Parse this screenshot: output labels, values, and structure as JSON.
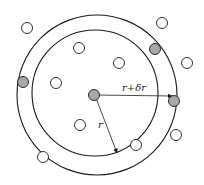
{
  "diagram": {
    "colors": {
      "line": "#1a1a1a",
      "filled": "#a8a8a8",
      "open": "#ffffff"
    },
    "outer_circle": {
      "cx": 97,
      "cy": 95,
      "r": 80
    },
    "inner_circle": {
      "cx": 95,
      "cy": 93,
      "r": 63
    },
    "labels": {
      "outer_radius": "r+δr",
      "inner_radius": "r"
    },
    "particles": [
      {
        "x": 94,
        "y": 95,
        "filled": true,
        "role": "central"
      },
      {
        "x": 27,
        "y": 28,
        "filled": false
      },
      {
        "x": 162,
        "y": 23,
        "filled": false
      },
      {
        "x": 155,
        "y": 49,
        "filled": true
      },
      {
        "x": 79,
        "y": 48,
        "filled": false
      },
      {
        "x": 119,
        "y": 63,
        "filled": false
      },
      {
        "x": 187,
        "y": 63,
        "filled": false
      },
      {
        "x": 23,
        "y": 82,
        "filled": true
      },
      {
        "x": 56,
        "y": 83,
        "filled": false
      },
      {
        "x": 174,
        "y": 101,
        "filled": true
      },
      {
        "x": 80,
        "y": 125,
        "filled": false
      },
      {
        "x": 176,
        "y": 135,
        "filled": false
      },
      {
        "x": 136,
        "y": 145,
        "filled": false
      },
      {
        "x": 43,
        "y": 157,
        "filled": false
      }
    ]
  }
}
